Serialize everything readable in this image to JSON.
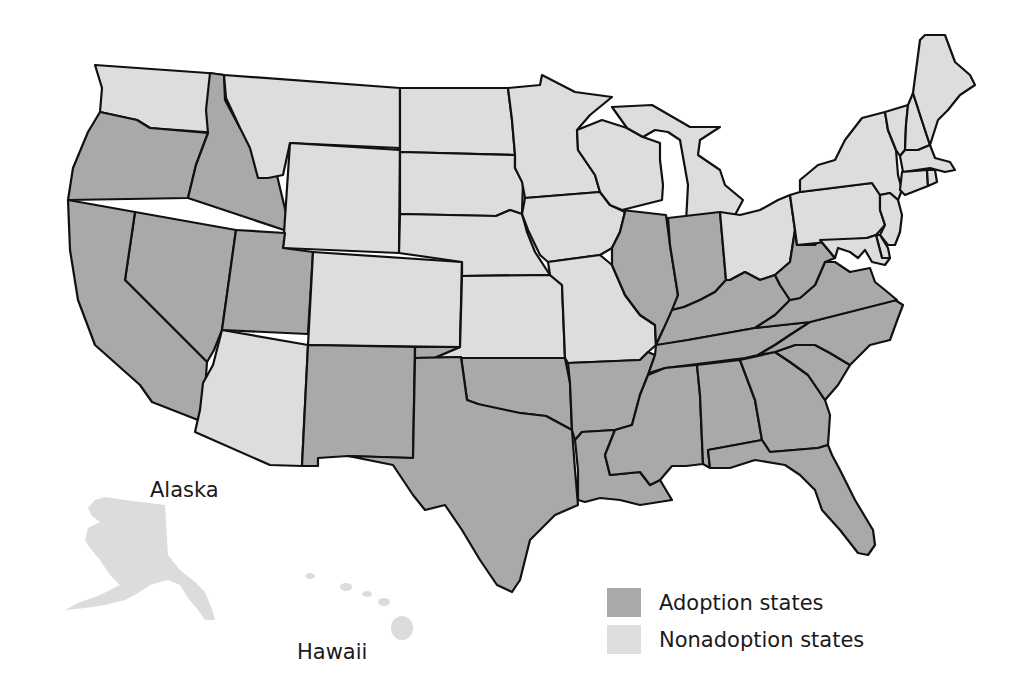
{
  "chart_data": {
    "type": "choropleth-map",
    "title": "",
    "categories": [
      "Adoption states",
      "Nonadoption states"
    ],
    "colors": {
      "adoption": "#a9a9a9",
      "nonadoption": "#dddddd",
      "border": "#111111"
    },
    "adoption_states": [
      "OR",
      "ID",
      "CA",
      "NV",
      "UT",
      "NM",
      "TX",
      "OK",
      "AR",
      "LA",
      "MS",
      "AL",
      "GA",
      "FL",
      "SC",
      "NC",
      "TN",
      "KY",
      "VA",
      "WV",
      "IL",
      "IN"
    ],
    "nonadoption_states": [
      "WA",
      "MT",
      "WY",
      "CO",
      "AZ",
      "ND",
      "SD",
      "NE",
      "KS",
      "MN",
      "IA",
      "MO",
      "WI",
      "MI",
      "OH",
      "PA",
      "NY",
      "VT",
      "NH",
      "ME",
      "MA",
      "RI",
      "CT",
      "NJ",
      "DE",
      "MD",
      "AK",
      "HI"
    ]
  },
  "labels": {
    "alaska": "Alaska",
    "hawaii": "Hawaii"
  },
  "legend": {
    "adoption_label": "Adoption states",
    "nonadoption_label": "Nonadoption states"
  },
  "states": [
    {
      "id": "WA",
      "status": "nonadoption",
      "points": "95,65 208,73 224,75 219,133 150,128 137,120 100,112 102,88"
    },
    {
      "id": "OR",
      "status": "adoption",
      "points": "100,112 137,120 150,128 208,133 196,165 188,198 68,200 73,168 88,132"
    },
    {
      "id": "ID",
      "status": "adoption",
      "points": "210,73 224,75 225,100 240,128 255,138 268,138 286,213 290,232 188,198 196,165 208,133 206,110"
    },
    {
      "id": "MT",
      "status": "nonadoption",
      "points": "224,75 400,88 400,148 290,143 283,175 268,178 258,178 250,148 240,128 226,98"
    },
    {
      "id": "WY",
      "status": "nonadoption",
      "points": "290,143 400,150 399,253 283,248"
    },
    {
      "id": "NV",
      "status": "adoption",
      "points": "135,212 236,230 222,330 214,350 207,362 125,280"
    },
    {
      "id": "CA",
      "status": "adoption",
      "points": "68,200 135,212 125,280 207,362 205,390 198,420 152,402 140,385 95,345 78,300 70,250"
    },
    {
      "id": "UT",
      "status": "adoption",
      "points": "236,230 285,233 283,248 313,252 308,334 222,330"
    },
    {
      "id": "CO",
      "status": "nonadoption",
      "points": "313,252 462,262 460,347 308,345"
    },
    {
      "id": "AZ",
      "status": "nonadoption",
      "points": "222,330 308,345 302,466 270,465 195,432 200,410 203,383 213,365"
    },
    {
      "id": "NM",
      "status": "adoption",
      "points": "308,345 415,347 413,458 348,456 318,458 318,466 302,466"
    },
    {
      "id": "ND",
      "status": "nonadoption",
      "points": "400,88 508,88 512,120 515,155 400,152"
    },
    {
      "id": "SD",
      "status": "nonadoption",
      "points": "400,152 515,155 515,168 523,182 522,214 510,210 496,216 400,214"
    },
    {
      "id": "NE",
      "status": "nonadoption",
      "points": "400,214 496,216 510,210 522,214 527,232 535,252 550,275 462,276 462,262 399,253"
    },
    {
      "id": "KS",
      "status": "nonadoption",
      "points": "462,276 550,275 562,285 565,358 434,358 460,347"
    },
    {
      "id": "OK",
      "status": "adoption",
      "points": "415,347 460,347 434,358 565,358 570,383 572,430 546,416 520,413 500,412 478,404 467,400 461,357 415,358"
    },
    {
      "id": "TX",
      "status": "adoption",
      "points": "415,358 461,357 467,400 478,404 520,413 546,416 572,430 575,470 578,505 555,515 530,540 520,580 512,592 497,585 480,560 462,530 445,505 425,510 413,495 393,465 348,456 413,458"
    },
    {
      "id": "MN",
      "status": "nonadoption",
      "points": "508,88 540,85 542,75 575,92 612,97 590,115 577,130 578,150 595,175 600,192 525,198 522,182 515,168 515,155 512,120"
    },
    {
      "id": "IA",
      "status": "nonadoption",
      "points": "525,198 600,192 610,205 625,212 620,232 612,248 600,255 548,262 540,255 528,230 522,214"
    },
    {
      "id": "MO",
      "status": "nonadoption",
      "points": "548,262 600,255 612,265 625,295 640,315 655,325 656,345 648,352 640,360 568,363 565,358 562,285 550,275"
    },
    {
      "id": "AR",
      "status": "adoption",
      "points": "568,363 640,360 648,352 655,355 648,375 640,395 632,425 615,430 582,432 575,440 572,430 570,383"
    },
    {
      "id": "LA",
      "status": "adoption",
      "points": "575,440 582,432 615,430 605,455 610,475 640,472 650,485 660,480 672,500 640,505 620,500 600,498 585,502 578,500 578,470"
    },
    {
      "id": "WI",
      "status": "nonadoption",
      "points": "577,130 602,120 627,128 643,137 660,143 660,160 663,185 662,200 622,210 610,205 600,192 595,175 578,150"
    },
    {
      "id": "MI",
      "status": "nonadoption",
      "points": "612,107 652,105 690,127 720,127 700,140 698,155 720,170 725,185 743,200 735,215 720,220 686,222 688,185 680,140 668,132 655,130 643,137 627,128"
    },
    {
      "id": "IL",
      "status": "adoption",
      "points": "622,210 666,215 670,245 678,295 672,322 663,330 656,345 655,325 640,315 625,295 612,265 612,248 620,232 625,212"
    },
    {
      "id": "IN",
      "status": "adoption",
      "points": "668,218 720,212 726,280 715,292 700,300 684,307 672,310 678,295 670,245"
    },
    {
      "id": "OH",
      "status": "nonadoption",
      "points": "720,212 740,215 760,210 778,200 790,195 795,230 790,262 775,275 760,280 745,272 730,280 726,280"
    },
    {
      "id": "KY",
      "status": "adoption",
      "points": "672,310 684,307 700,300 715,292 726,280 730,280 745,272 760,280 775,275 780,285 790,300 775,315 755,328 688,340 660,345 656,345 663,330"
    },
    {
      "id": "TN",
      "status": "adoption",
      "points": "656,345 688,340 755,328 810,322 790,335 775,345 758,355 745,358 665,368 652,372 648,375 655,355"
    },
    {
      "id": "MS",
      "status": "adoption",
      "points": "648,375 665,368 697,365 700,395 703,464 686,466 672,466 660,480 650,485 640,472 610,475 605,455 615,430 632,425 640,395"
    },
    {
      "id": "AL",
      "status": "adoption",
      "points": "697,365 740,360 755,400 762,440 708,450 710,468 703,464 700,395"
    },
    {
      "id": "GA",
      "status": "adoption",
      "points": "740,360 775,352 790,362 808,375 825,400 830,415 828,445 818,448 770,452 762,440 755,400"
    },
    {
      "id": "FL",
      "status": "adoption",
      "points": "708,450 762,440 770,452 818,448 828,445 832,455 840,470 855,500 873,530 875,545 868,555 858,553 840,530 822,510 815,490 800,475 785,465 755,460 730,468 710,468"
    },
    {
      "id": "SC",
      "status": "adoption",
      "points": "775,352 795,345 815,345 830,353 850,365 838,385 825,400 808,375 790,362"
    },
    {
      "id": "NC",
      "status": "adoption",
      "points": "758,355 775,345 790,335 810,322 895,300 903,305 898,318 890,340 870,345 850,365 830,353 815,345 795,345 775,352"
    },
    {
      "id": "VA",
      "status": "adoption",
      "points": "755,328 775,315 790,300 800,298 815,285 825,262 835,262 850,272 870,268 875,282 885,290 897,300 810,322"
    },
    {
      "id": "WV",
      "status": "adoption",
      "points": "775,275 790,262 795,230 797,245 815,245 820,240 835,258 825,262 815,285 800,298 790,300 780,285"
    },
    {
      "id": "PA",
      "status": "nonadoption",
      "points": "790,195 800,192 872,183 880,195 880,210 885,225 876,235 867,238 797,245 795,230"
    },
    {
      "id": "NY",
      "status": "nonadoption",
      "points": "800,192 800,180 818,165 835,160 845,140 862,118 885,112 888,130 896,150 898,175 902,190 898,200 890,193 880,195 872,183"
    },
    {
      "id": "VT",
      "status": "nonadoption",
      "points": "885,112 908,105 906,125 905,150 900,156 896,150 888,130"
    },
    {
      "id": "NH",
      "status": "nonadoption",
      "points": "908,105 913,93 925,130 930,145 918,150 905,150 906,125"
    },
    {
      "id": "ME",
      "status": "nonadoption",
      "points": "913,93 920,40 925,35 945,35 955,62 970,75 975,85 960,95 948,110 938,120 930,145 925,130"
    },
    {
      "id": "MA",
      "status": "nonadoption",
      "points": "900,156 905,150 918,150 930,145 935,158 950,162 955,170 945,172 930,168 903,172"
    },
    {
      "id": "CT",
      "status": "nonadoption",
      "points": "902,172 927,170 928,186 905,195 900,190"
    },
    {
      "id": "RI",
      "status": "nonadoption",
      "points": "927,170 935,170 937,182 928,186"
    },
    {
      "id": "NJ",
      "status": "nonadoption",
      "points": "880,195 890,193 898,200 902,215 900,232 895,245 888,245 880,235 885,225 880,210"
    },
    {
      "id": "DE",
      "status": "nonadoption",
      "points": "876,235 880,235 888,248 890,258 882,258"
    },
    {
      "id": "MD",
      "status": "nonadoption",
      "points": "820,240 867,238 876,235 882,258 890,258 885,265 872,262 865,250 858,258 850,252 838,248 835,258"
    }
  ],
  "outlying": {
    "alaska": "95,500 105,497 125,500 165,505 168,555 180,570 195,582 205,592 213,612 215,620 205,620 198,610 188,598 180,585 168,580 160,582 150,585 140,592 125,600 105,605 85,608 65,610 78,603 100,595 120,585 110,575 100,560 90,548 85,540 88,528 100,522 92,516 88,508",
    "hawaii": [
      {
        "cx": 310,
        "cy": 576,
        "rx": 5,
        "ry": 3
      },
      {
        "cx": 346,
        "cy": 587,
        "rx": 6,
        "ry": 4
      },
      {
        "cx": 367,
        "cy": 594,
        "rx": 5,
        "ry": 3
      },
      {
        "cx": 384,
        "cy": 602,
        "rx": 6,
        "ry": 4
      },
      {
        "cx": 402,
        "cy": 628,
        "rx": 11,
        "ry": 12
      }
    ]
  }
}
